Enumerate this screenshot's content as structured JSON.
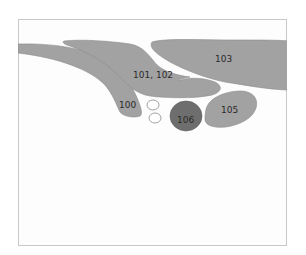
{
  "diagram": {
    "colors": {
      "frame_border": "#c8c8c8",
      "background": "#ffffff",
      "region_fill": "#a2a2a2",
      "region_stroke": "#888888",
      "dark_region_fill": "#6e6e6e",
      "outline_stroke": "#888888",
      "label_color": "#2a2a2a"
    },
    "regions": [
      {
        "id": "100",
        "label": "100"
      },
      {
        "id": "101-102",
        "label": "101, 102"
      },
      {
        "id": "103",
        "label": "103"
      },
      {
        "id": "105",
        "label": "105"
      },
      {
        "id": "106",
        "label": "106"
      }
    ],
    "unlabeled_outlines": 2
  }
}
